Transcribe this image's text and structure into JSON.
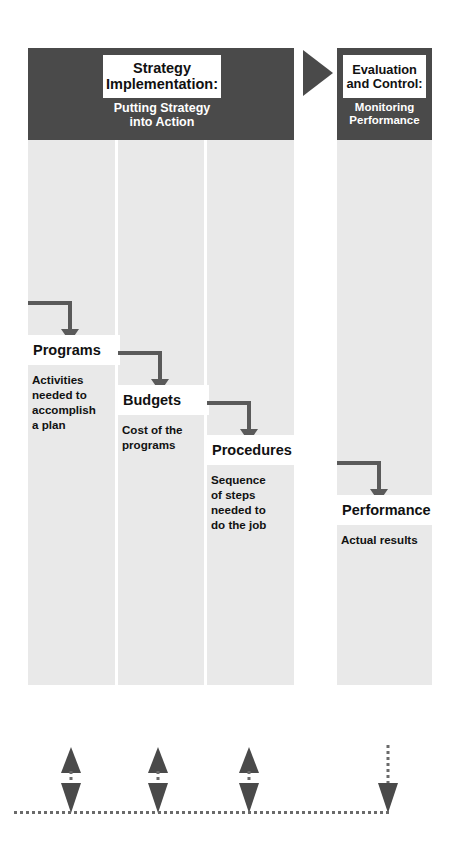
{
  "diagram": {
    "colors": {
      "dark_band": "#4a4a4a",
      "column_fill": "#e9e9e9",
      "plate_fill": "#ffffff",
      "arrow_gray": "#5a5a5a",
      "text_dark": "#111111",
      "text_light": "#ffffff"
    }
  },
  "headers": {
    "left": {
      "plate_lines": [
        "Strategy",
        "Implementation:"
      ],
      "subcaption_lines": [
        "Putting Strategy",
        "into Action"
      ]
    },
    "right": {
      "plate_lines": [
        "Evaluation",
        "and Control:"
      ],
      "subcaption_lines": [
        "Monitoring",
        "Performance"
      ]
    },
    "connector_icon": "triangle-right-icon"
  },
  "columns": [
    {
      "id": "programs",
      "label": "Programs",
      "description_lines": [
        "Activities",
        "needed to",
        "accomplish",
        "a plan"
      ],
      "connector": "elbow-arrow-down-icon"
    },
    {
      "id": "budgets",
      "label": "Budgets",
      "description_lines": [
        "Cost of the",
        "programs"
      ],
      "connector": "elbow-arrow-down-icon"
    },
    {
      "id": "procedures",
      "label": "Procedures",
      "description_lines": [
        "Sequence",
        "of steps",
        "needed to",
        "do the job"
      ],
      "connector": "elbow-arrow-down-icon"
    },
    {
      "id": "performance",
      "label": "Performance",
      "description_lines": [
        "Actual results"
      ],
      "connector": "elbow-arrow-down-icon"
    }
  ],
  "feedback": {
    "label": "Feedback / Learning loop",
    "arrows": [
      {
        "id": "feedback-programs",
        "type": "double-headed-dotted-arrow-icon"
      },
      {
        "id": "feedback-budgets",
        "type": "double-headed-dotted-arrow-icon"
      },
      {
        "id": "feedback-procedures",
        "type": "double-headed-dotted-arrow-icon"
      },
      {
        "id": "feedback-performance",
        "type": "dotted-arrow-down-icon"
      }
    ],
    "rail": "dotted-horizontal-rail-icon"
  }
}
